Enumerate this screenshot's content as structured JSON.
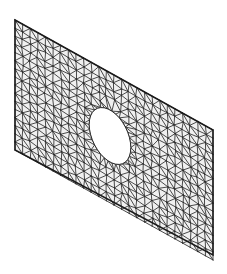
{
  "figure": {
    "name": "fem-mesh-plate-with-elliptical-hole",
    "type": "finite-element-mesh-diagram",
    "title": "",
    "caption": "",
    "projection": "oblique-parallel",
    "background_color": "#ffffff",
    "face_color": "#f0f0f0",
    "edge_color": "#2b2b2b",
    "outline_color": "#1a1a1a",
    "hole_fill_color": "#ffffff",
    "edge_width": 0.85,
    "outline_width": 1.5,
    "canvas": {
      "width": 227,
      "height": 274
    }
  },
  "geometry": {
    "plate": {
      "shape": "parallelogram",
      "corners": [
        {
          "label": "top-left",
          "x": 15,
          "y": 20
        },
        {
          "label": "top-right",
          "x": 213,
          "y": 130
        },
        {
          "label": "bottom-right",
          "x": 213,
          "y": 255
        },
        {
          "label": "bottom-left",
          "x": 15,
          "y": 150
        }
      ],
      "edge_vector_u": {
        "dx": 198,
        "dy": 110
      },
      "edge_vector_v": {
        "dx": 0,
        "dy": 130
      },
      "parametric_nu": 26,
      "parametric_nv": 16
    },
    "hole": {
      "shape": "ellipse",
      "center": {
        "x": 110,
        "y": 136
      },
      "radius_u": 0.105,
      "radius_v": 0.2,
      "rotation_deg": 0,
      "segments": 34,
      "label": "elliptical-cutout"
    }
  },
  "mesh": {
    "element_type": "triangle",
    "algorithm": "delaunay",
    "refinement": "graded-toward-hole",
    "seed": 20240517,
    "jitter": 0.26
  }
}
